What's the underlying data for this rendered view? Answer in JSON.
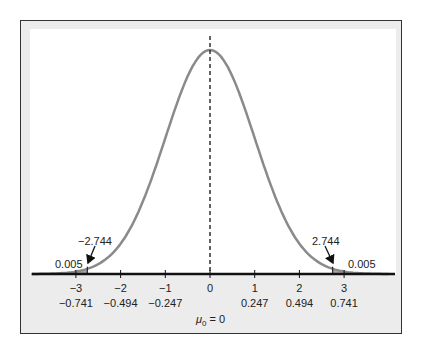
{
  "figure": {
    "type": "normal-distribution-diagram",
    "mean_label": "μ₀ = 0",
    "mean_symbol": "μ",
    "mean_subscript": "0",
    "mean_value_text": "= 0",
    "curve_color": "#8a8a8a",
    "tail_fill_color": "#a9a9a9",
    "panel_color": "#ececec",
    "critical_values": {
      "left_label": "−2.744",
      "right_label": "2.744",
      "left": -2.744,
      "right": 2.744
    },
    "tail_areas": {
      "left_label": "0.005",
      "right_label": "0.005"
    },
    "axis": {
      "t_ticks": [
        -3,
        -2,
        -1,
        0,
        1,
        2,
        3
      ],
      "t_tick_labels": [
        "−3",
        "−2",
        "−1",
        "0",
        "1",
        "2",
        "3"
      ],
      "mean_diff_labels": [
        "−0.741",
        "−0.494",
        "−0.247",
        "",
        "0.247",
        "0.494",
        "0.741"
      ]
    }
  },
  "chart_data": {
    "type": "area",
    "title": "",
    "distribution": "t / standard normal",
    "center": 0,
    "x_ticks": [
      -3,
      -2,
      -1,
      0,
      1,
      2,
      3
    ],
    "x_tick_labels_row1": [
      "−3",
      "−2",
      "−1",
      "0",
      "1",
      "2",
      "3"
    ],
    "x_tick_labels_row2": [
      "−0.741",
      "−0.494",
      "−0.247",
      "",
      "0.247",
      "0.494",
      "0.741"
    ],
    "shaded_regions": [
      {
        "from": -4,
        "to": -2.744,
        "area": 0.005,
        "label": "0.005"
      },
      {
        "from": 2.744,
        "to": 4,
        "area": 0.005,
        "label": "0.005"
      }
    ],
    "annotations": [
      "−2.744",
      "2.744",
      "0.005",
      "0.005",
      "μ₀ = 0"
    ],
    "xlabel": "μ₀ = 0",
    "ylabel": "",
    "xlim": [
      -4,
      4
    ],
    "grid": false
  }
}
